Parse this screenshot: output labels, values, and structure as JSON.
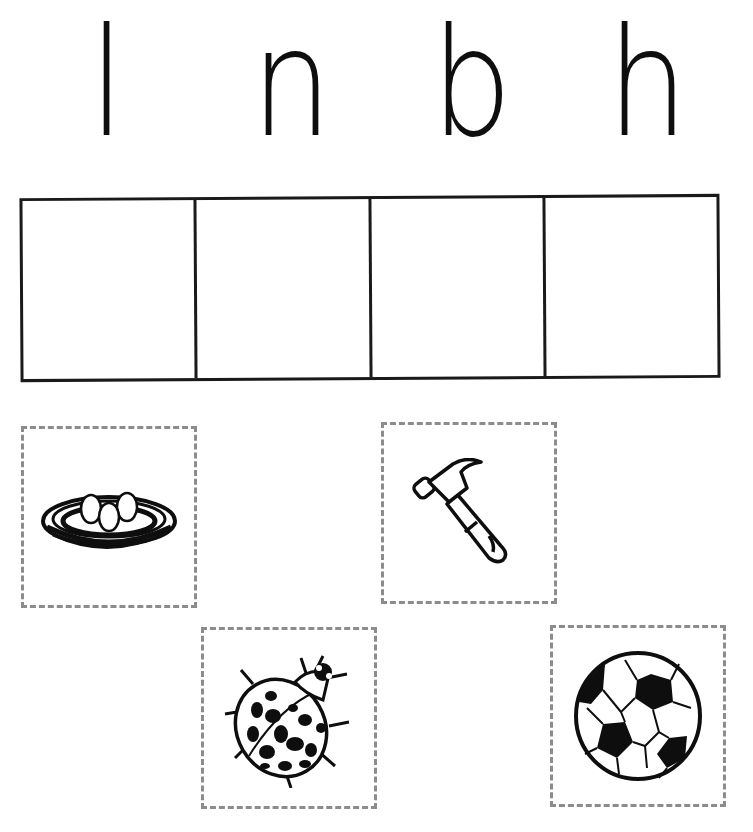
{
  "worksheet": {
    "letters": [
      "l",
      "n",
      "b",
      "h"
    ],
    "answer_boxes": 4,
    "cut_out_cards": [
      {
        "picture": "nest-with-eggs",
        "starts_with": "n"
      },
      {
        "picture": "hammer",
        "starts_with": "h"
      },
      {
        "picture": "ladybug",
        "starts_with": "l"
      },
      {
        "picture": "soccer-ball",
        "starts_with": "b"
      }
    ]
  },
  "colors": {
    "ink": "#0e0e0e",
    "dashed_border": "#8c8c8c",
    "background": "#ffffff"
  }
}
